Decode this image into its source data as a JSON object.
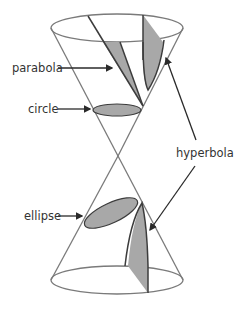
{
  "diagram": {
    "labels": {
      "parabola": "parabola",
      "circle": "circle",
      "hyperbola": "hyperbola",
      "ellipse": "ellipse"
    },
    "colors": {
      "cone_outline": "#7a7a7a",
      "section_fill": "#a8a8a8",
      "section_edge": "#3c3c3c",
      "arrow": "#2a2a2a",
      "label_text": "#333333",
      "background": "#ffffff"
    }
  }
}
